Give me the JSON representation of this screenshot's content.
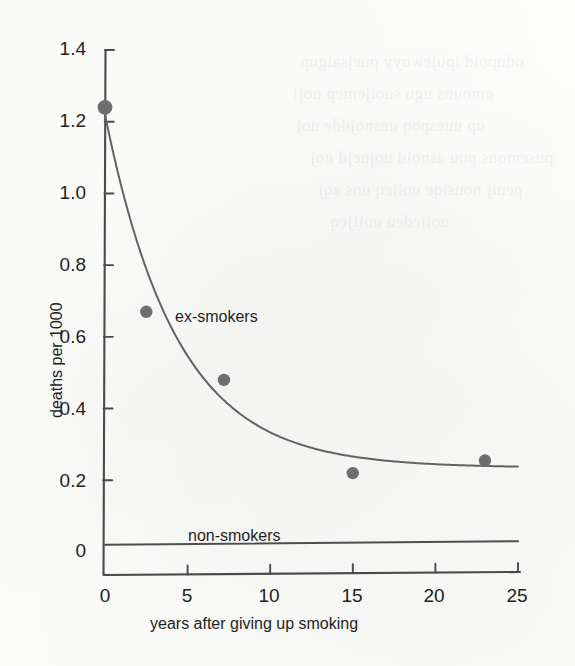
{
  "figure": {
    "background_color": "#fdfdfc",
    "ink_color": "#3a3a3a",
    "marker_color": "#6e6e6e"
  },
  "chart_data": {
    "type": "scatter",
    "title": "",
    "subtitle": "",
    "xlabel": "years after giving up smoking",
    "ylabel": "deaths per 1000",
    "xlim": [
      0,
      25
    ],
    "ylim": [
      0,
      1.4
    ],
    "xticks": [
      0,
      5,
      10,
      15,
      20,
      25
    ],
    "yticks": [
      0,
      0.2,
      0.4,
      0.6,
      0.8,
      1.0,
      1.2,
      1.4
    ],
    "xtick_labels": [
      "0",
      "5",
      "10",
      "15",
      "20",
      "25"
    ],
    "ytick_labels": [
      "0",
      "0.2",
      "0.4",
      "0.6",
      "0.8",
      "1.0",
      "1.2",
      "1.4"
    ],
    "grid": false,
    "legend": "inline-annotations",
    "series": [
      {
        "name": "ex-smokers",
        "label": "ex-smokers",
        "marker": "filled-circle",
        "fit": "exponential-decay",
        "x": [
          0,
          2.5,
          7.2,
          15,
          23
        ],
        "values": [
          1.24,
          0.67,
          0.48,
          0.22,
          0.255
        ],
        "curve": {
          "description": "fitted exponential decay with asymptote",
          "y0": 1.22,
          "asymptote": 0.235,
          "decay_constant": 0.23
        },
        "annotation": {
          "text": "ex-smokers",
          "x": 6.4,
          "y": 0.66
        }
      },
      {
        "name": "non-smokers",
        "label": "non-smokers",
        "marker": "none",
        "x": [
          0,
          25
        ],
        "values": [
          0.02,
          0.03
        ],
        "annotation": {
          "text": "non-smokers",
          "x": 6.5,
          "y": 0.095
        }
      }
    ]
  },
  "axes": {
    "y_title": "deaths per 1000",
    "x_title": "years after giving up smoking",
    "y_tick_labels": [
      "1.4",
      "1.2",
      "1.0",
      "0.8",
      "0.6",
      "0.4",
      "0.2",
      "0"
    ],
    "x_tick_labels": [
      "0",
      "5",
      "10",
      "15",
      "20",
      "25"
    ]
  },
  "annotations": {
    "ex_smokers": "ex-smokers",
    "non_smokers": "non-smokers"
  },
  "page_artifacts": {
    "bleed_lines": [
      "odupoid ipujewoyy puejsaigup",
      "emouos ugu suoijemep uoj!",
      "up uuespoq uesnojdde uoj",
      "pusemous pou asnoid uojuejd uoj",
      "peuij nousiqe uoijeq uos aqj",
      "uoiiedeu uoi!jeq"
    ]
  }
}
